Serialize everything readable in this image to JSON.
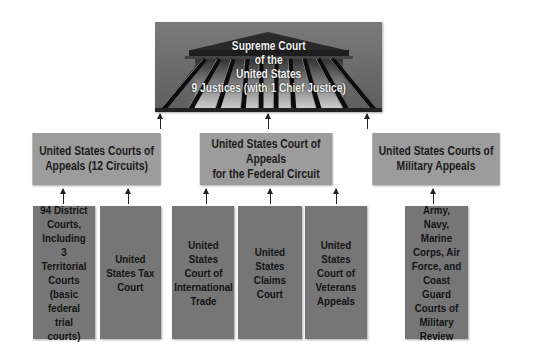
{
  "diagram": {
    "type": "hierarchy",
    "top": {
      "label": "Supreme Court\nof the\nUnited States\n9 Justices (with 1 Chief Justice)",
      "icon": "courthouse-columns-icon"
    },
    "middle": [
      {
        "label": "United States Courts of\nAppeals (12 Circuits)"
      },
      {
        "label": "United States Court of Appeals\nfor the Federal Circuit"
      },
      {
        "label": "United States Courts of\nMilitary Appeals"
      }
    ],
    "bottom": [
      {
        "label": "94 District\nCourts,\nIncluding\n3 Territorial\nCourts\n(basic\nfederal\ntrial courts)",
        "parent": 0
      },
      {
        "label": "United\nStates Tax\nCourt",
        "parent": 0
      },
      {
        "label": "United\nStates\nCourt of\nInternational\nTrade",
        "parent": 1
      },
      {
        "label": "United\nStates\nClaims\nCourt",
        "parent": 1
      },
      {
        "label": "United\nStates\nCourt of\nVeterans\nAppeals",
        "parent": 1
      },
      {
        "label": "Army,\nNavy, Marine\nCorps, Air\nForce, and\nCoast Guard\nCourts of\nMilitary\nReview",
        "parent": 2
      }
    ],
    "colors": {
      "top_bg": "#6f6f6f",
      "middle_bg": "#9c9c9c",
      "bottom_bg": "#767676",
      "top_text": "#f2f2f2",
      "text": "#1a1a1a"
    }
  }
}
